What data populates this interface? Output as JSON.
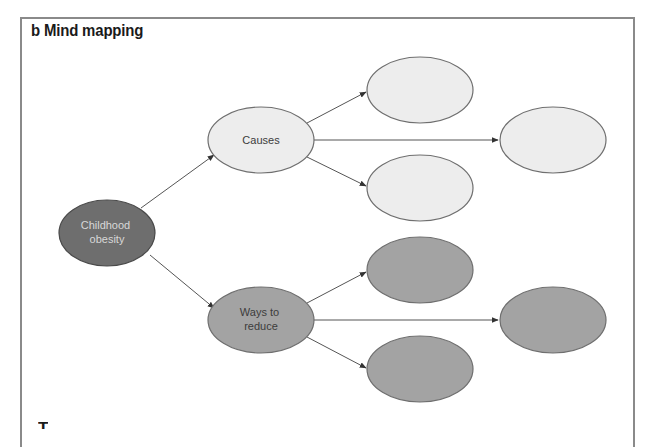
{
  "figure": {
    "title": "b Mind mapping",
    "cutoff_heading": "T"
  },
  "colors": {
    "frame": "#8a8a8a",
    "edge": "#555555",
    "root_fill": "#6e6e6e",
    "root_text": "#d8d8d8",
    "light_fill": "#ededed",
    "medium_fill": "#a3a3a3",
    "node_stroke": "#6f6f6f",
    "label_text": "#3c3c3c"
  },
  "mind_map": {
    "root": {
      "id": "childhood-obesity",
      "label_lines": [
        "Childhood",
        "obesity"
      ]
    },
    "branches": [
      {
        "id": "causes",
        "label_lines": [
          "Causes"
        ],
        "children": [
          {
            "id": "causes-child-1",
            "label": ""
          },
          {
            "id": "causes-child-2",
            "label": ""
          },
          {
            "id": "causes-child-3",
            "label": ""
          }
        ]
      },
      {
        "id": "ways-to-reduce",
        "label_lines": [
          "Ways to",
          "reduce"
        ],
        "children": [
          {
            "id": "reduce-child-1",
            "label": ""
          },
          {
            "id": "reduce-child-2",
            "label": ""
          },
          {
            "id": "reduce-child-3",
            "label": ""
          }
        ]
      }
    ]
  }
}
